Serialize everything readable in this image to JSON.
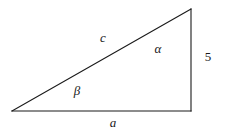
{
  "figure": {
    "type": "geometry-diagram",
    "shape": "right-triangle",
    "background_color": "#ffffff",
    "stroke_color": "#1a1a1a",
    "stroke_width": 1,
    "width": 231,
    "height": 137,
    "vertices": {
      "left": {
        "x": 12,
        "y": 111
      },
      "bottom_right": {
        "x": 191,
        "y": 111
      },
      "apex": {
        "x": 191,
        "y": 9
      }
    },
    "labels": [
      {
        "id": "hypotenuse-label",
        "text": "c",
        "x": 103,
        "y": 37,
        "style": "italic",
        "role": "side"
      },
      {
        "id": "angle-alpha-label",
        "text": "α",
        "x": 158,
        "y": 48,
        "style": "italic",
        "role": "angle"
      },
      {
        "id": "angle-beta-label",
        "text": "β",
        "x": 77,
        "y": 90,
        "style": "italic",
        "role": "angle"
      },
      {
        "id": "opposite-side-label",
        "text": "5",
        "x": 208,
        "y": 56,
        "style": "upright",
        "role": "side"
      },
      {
        "id": "adjacent-side-label",
        "text": "a",
        "x": 113,
        "y": 122,
        "style": "italic",
        "role": "side"
      }
    ]
  }
}
